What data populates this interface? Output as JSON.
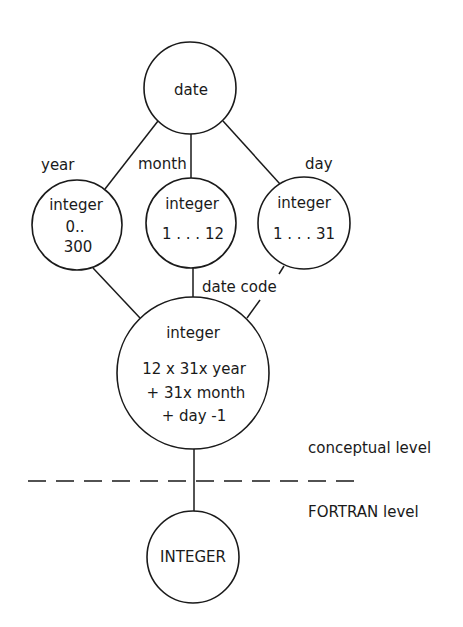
{
  "diagram": {
    "top_node": {
      "label": "date"
    },
    "components": [
      {
        "edge_label": "year",
        "type": "integer",
        "range_line1": "0..",
        "range_line2": "300"
      },
      {
        "edge_label": "month",
        "type": "integer",
        "range": "1 . . . 12"
      },
      {
        "edge_label": "day",
        "type": "integer",
        "range": "1 . . . 31"
      }
    ],
    "code_edge_label": "date code",
    "code_node": {
      "type": "integer",
      "formula": [
        "12 x 31x year",
        "+ 31x month",
        "+ day -1"
      ]
    },
    "levels": {
      "upper": "conceptual level",
      "lower": "FORTRAN level"
    },
    "fortran_node": {
      "label": "INTEGER"
    }
  },
  "colors": {
    "ink": "#1a1a1a",
    "background": "#ffffff"
  }
}
